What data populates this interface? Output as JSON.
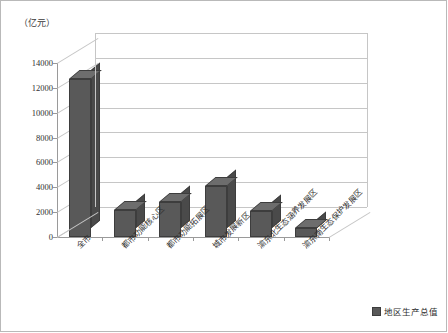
{
  "chart_data": {
    "type": "bar",
    "title": "",
    "subtitle": "",
    "unit_label": "（亿元）",
    "xlabel": "",
    "ylabel": "",
    "ylim": [
      0,
      14000
    ],
    "yticks": [
      0,
      2000,
      4000,
      6000,
      8000,
      10000,
      12000,
      14000
    ],
    "grid": true,
    "legend_position": "bottom-right",
    "categories": [
      "全市",
      "都市功能核心区",
      "都市功能拓展区",
      "城市发展新区",
      "渝东北生态涵养发展区",
      "渝东南生态保护发展区"
    ],
    "series": [
      {
        "name": "地区生产总值",
        "color": "#595959",
        "values": [
          12700,
          2200,
          2800,
          4100,
          2100,
          750
        ]
      }
    ]
  },
  "legend": {
    "items": [
      {
        "label": "地区生产总值",
        "swatch": "legend-swatch"
      }
    ]
  },
  "axis": {
    "unit": "（亿元）"
  }
}
